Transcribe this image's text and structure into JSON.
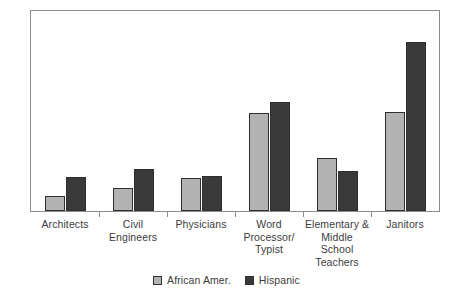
{
  "chart_data": {
    "type": "bar",
    "title": "",
    "subtitle": "",
    "xlabel": "",
    "ylabel": "",
    "ylim": [
      0,
      35
    ],
    "y_ticks": [
      0,
      5,
      10,
      15,
      20,
      25,
      30,
      35
    ],
    "grid": false,
    "legend_position": "bottom-center",
    "categories": [
      "Architects",
      "Civil Engineers",
      "Physicians",
      "Word Processor/ Typist",
      "Elementary & Middle School Teachers",
      "Janitors"
    ],
    "category_lines": [
      [
        "Architects"
      ],
      [
        "Civil",
        "Engineers"
      ],
      [
        "Physicians"
      ],
      [
        "Word",
        "Processor/",
        "Typist"
      ],
      [
        "Elementary &",
        "Middle",
        "School",
        "Teachers"
      ],
      [
        "Janitors"
      ]
    ],
    "series": [
      {
        "name": "African Amer.",
        "color": "#b3b3b3",
        "values": [
          2.7,
          4.0,
          5.7,
          17.1,
          9.3,
          17.4
        ]
      },
      {
        "name": "Hispanic",
        "color": "#3a3a3a",
        "values": [
          5.9,
          7.3,
          6.1,
          19.1,
          7.0,
          29.5
        ]
      }
    ]
  },
  "legend": {
    "items": [
      {
        "label": "African Amer.",
        "color": "#b3b3b3"
      },
      {
        "label": "Hispanic",
        "color": "#3a3a3a"
      }
    ]
  },
  "axis": {
    "frame_color": "#8d8d8d"
  }
}
